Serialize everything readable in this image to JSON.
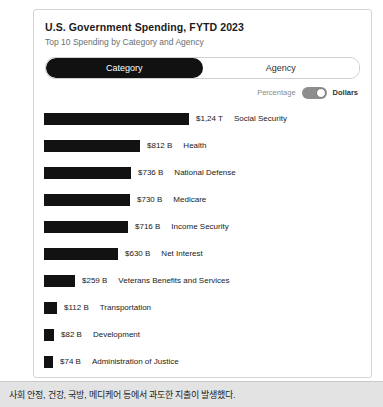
{
  "card": {
    "title": "U.S. Government Spending, FYTD 2023",
    "subtitle": "Top 10 Spending by Category and Agency"
  },
  "segmented": {
    "options": [
      {
        "label": "Category",
        "active": true
      },
      {
        "label": "Agency",
        "active": false
      }
    ]
  },
  "unit_toggle": {
    "left_label": "Percentage",
    "right_label": "Dollars",
    "selected": "Dollars"
  },
  "colors": {
    "bar": "#121212",
    "active_tab_bg": "#111111",
    "active_tab_text": "#ffffff",
    "card_border": "#d4d4d4",
    "switch_track": "#8d8d8d",
    "switch_knob": "#ffffff",
    "footer_bg": "#e3e3e3"
  },
  "footer": {
    "text": "사회 안정, 건강, 국방, 메디케어 등에서 과도한 지출이 발생했다."
  },
  "chart_data": {
    "type": "bar",
    "orientation": "horizontal",
    "title": "U.S. Government Spending, FYTD 2023",
    "subtitle": "Top 10 Spending by Category and Agency",
    "xlabel": "",
    "ylabel": "",
    "grid": false,
    "legend": "none",
    "unit": "Dollars",
    "value_basis": "USD",
    "categories": [
      "Social Security",
      "Health",
      "National Defense",
      "Medicare",
      "Income Security",
      "Net Interest",
      "Veterans Benefits and Services",
      "Transportation",
      "Development",
      "Administration of Justice"
    ],
    "value_labels": [
      "$1,24 T",
      "$812 B",
      "$736 B",
      "$730 B",
      "$716 B",
      "$630 B",
      "$259 B",
      "$112 B",
      "$82 B",
      "$74 B"
    ],
    "values": [
      1240,
      812,
      736,
      730,
      716,
      630,
      259,
      112,
      82,
      74
    ],
    "value_units": "billions USD",
    "xlim": [
      0,
      1240
    ],
    "bar_px": [
      145,
      96,
      87,
      86,
      84,
      74,
      31,
      13,
      10,
      9
    ],
    "rows": [
      {
        "category": "Social Security",
        "value_label": "$1,24 T",
        "value": 1240,
        "bar_px": 145
      },
      {
        "category": "Health",
        "value_label": "$812 B",
        "value": 812,
        "bar_px": 96
      },
      {
        "category": "National Defense",
        "value_label": "$736 B",
        "value": 736,
        "bar_px": 87
      },
      {
        "category": "Medicare",
        "value_label": "$730 B",
        "value": 730,
        "bar_px": 86
      },
      {
        "category": "Income Security",
        "value_label": "$716 B",
        "value": 716,
        "bar_px": 84
      },
      {
        "category": "Net Interest",
        "value_label": "$630 B",
        "value": 630,
        "bar_px": 74
      },
      {
        "category": "Veterans Benefits and Services",
        "value_label": "$259 B",
        "value": 259,
        "bar_px": 31
      },
      {
        "category": "Transportation",
        "value_label": "$112 B",
        "value": 112,
        "bar_px": 13
      },
      {
        "category": "Development",
        "value_label": "$82 B",
        "value": 82,
        "bar_px": 10
      },
      {
        "category": "Administration of Justice",
        "value_label": "$74 B",
        "value": 74,
        "bar_px": 9
      }
    ]
  }
}
